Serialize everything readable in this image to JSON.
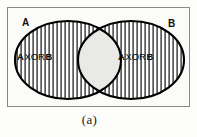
{
  "figure": {
    "caption": "(a)",
    "diagram_type": "venn-diagram",
    "colors": {
      "background": "#fdfdfb",
      "frame_border": "#8a8a84",
      "ellipse_outline": "#000000",
      "hatch_line": "#1a1a1a",
      "intersection_fill": "#e9e9e6",
      "text": "#101010"
    }
  },
  "sets": {
    "left_label": "A",
    "right_label": "B"
  },
  "regions": {
    "left": {
      "operand_a": "A",
      "operator": "XOR",
      "operand_b": "B",
      "shading": "vertical-hatch"
    },
    "right": {
      "operand_a": "A",
      "operator": "XOR",
      "operand_b": "B",
      "shading": "vertical-hatch"
    },
    "intersection": {
      "shading": "solid-light-gray"
    }
  },
  "geometry": {
    "frame": {
      "x": 7,
      "y": 7,
      "width": 183,
      "height": 100
    },
    "left_ellipse": {
      "cx": 60,
      "cy": 52,
      "rx": 53,
      "ry": 39
    },
    "right_ellipse": {
      "cx": 123,
      "cy": 52,
      "rx": 53,
      "ry": 39
    },
    "hatch_spacing_px": 4
  }
}
